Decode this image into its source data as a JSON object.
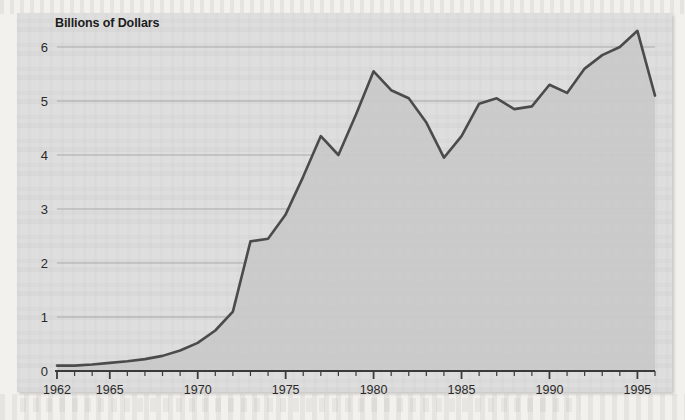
{
  "figure": {
    "title": "Billions of Dollars",
    "panel_background": "#dedede",
    "page_background": "#f2f1ee"
  },
  "chart_data": {
    "type": "area",
    "title": "Billions of Dollars",
    "xlabel": "",
    "ylabel": "Billions of Dollars",
    "xlim": [
      1962,
      1996
    ],
    "ylim": [
      0,
      6.5
    ],
    "yticks": [
      0,
      1,
      2,
      3,
      4,
      5,
      6
    ],
    "ytick_labels": [
      "0",
      "1",
      "2",
      "3",
      "4",
      "5",
      "6"
    ],
    "xtick_labels": [
      "1962",
      "1965",
      "1970",
      "1975",
      "1980",
      "1985",
      "1990",
      "1995"
    ],
    "xtick_label_years": [
      1962,
      1965,
      1970,
      1975,
      1980,
      1985,
      1990,
      1995
    ],
    "x_minor_tick_interval": 1,
    "grid": "horizontal",
    "legend": "none",
    "line_color": "#4b4b4b",
    "fill_color": "#c9c9c9",
    "x": [
      1962,
      1963,
      1964,
      1965,
      1966,
      1967,
      1968,
      1969,
      1970,
      1971,
      1972,
      1973,
      1974,
      1975,
      1976,
      1977,
      1978,
      1979,
      1980,
      1981,
      1982,
      1983,
      1984,
      1985,
      1986,
      1987,
      1988,
      1989,
      1990,
      1991,
      1992,
      1993,
      1994,
      1995,
      1996
    ],
    "values": [
      0.1,
      0.1,
      0.12,
      0.15,
      0.18,
      0.22,
      0.28,
      0.38,
      0.52,
      0.75,
      1.1,
      2.4,
      2.45,
      2.9,
      3.6,
      4.35,
      4.0,
      4.75,
      5.55,
      5.2,
      5.05,
      4.6,
      3.95,
      4.35,
      4.95,
      5.05,
      4.85,
      4.9,
      5.3,
      5.15,
      5.6,
      5.85,
      6.0,
      6.3,
      5.1
    ]
  }
}
